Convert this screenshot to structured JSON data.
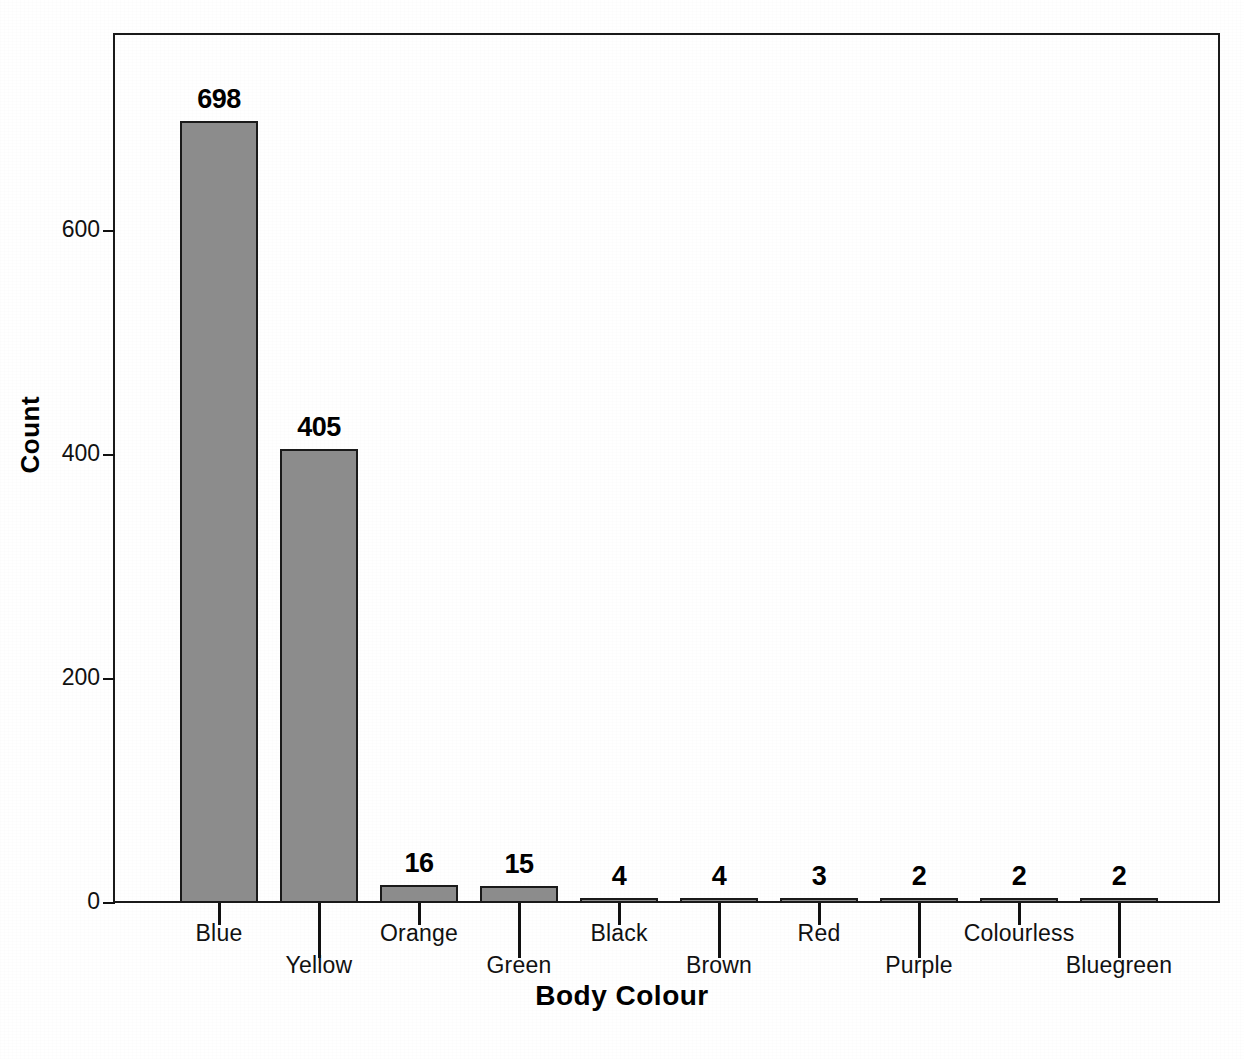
{
  "chart_data": {
    "type": "bar",
    "title": "",
    "xlabel": "Body Colour",
    "ylabel": "Count",
    "categories": [
      "Blue",
      "Yellow",
      "Orange",
      "Green",
      "Black",
      "Brown",
      "Red",
      "Purple",
      "Colourless",
      "Bluegreen"
    ],
    "values": [
      698,
      405,
      16,
      15,
      4,
      4,
      3,
      2,
      2,
      2
    ],
    "value_labels": [
      "698",
      "405",
      "16",
      "15",
      "4",
      "4",
      "3",
      "2",
      "2",
      "2"
    ],
    "ylim": [
      0,
      775
    ],
    "yticks": [
      0,
      200,
      400,
      600
    ],
    "ytick_labels": [
      "0",
      "200",
      "400",
      "600"
    ],
    "grid": false,
    "legend": "none",
    "bar_fill": "#8c8c8c",
    "bar_border": "#1a1a1a",
    "axis_color": "#111111",
    "background": "#ffffff"
  }
}
